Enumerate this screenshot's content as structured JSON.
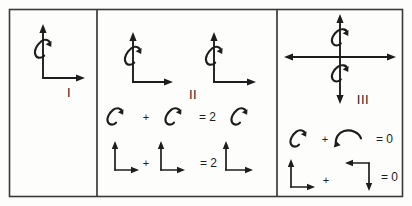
{
  "figure": {
    "background_color": "#fdfdfb",
    "ink_color": "#1d1d1d",
    "border_color": "#3a3a3a",
    "width": 412,
    "height": 206
  },
  "panels": [
    {
      "id": "panel-1",
      "label": "I",
      "description": "Single L-shaped axis pair with a counterclockwise rotation curl around the vertical axis",
      "items": [
        {
          "kind": "axis-pair",
          "name": "axis-pair-up-right"
        },
        {
          "kind": "rotation-curl",
          "name": "rotation-curl-ccw"
        }
      ],
      "equations": []
    },
    {
      "id": "panel-2",
      "label": "II",
      "description": "Two identical axis pairs with rotation curls, and two addition equations",
      "items": [
        {
          "kind": "axis-pair",
          "name": "axis-pair-up-right-left"
        },
        {
          "kind": "rotation-curl",
          "name": "rotation-curl-ccw-left"
        },
        {
          "kind": "axis-pair",
          "name": "axis-pair-up-right-right"
        },
        {
          "kind": "rotation-curl",
          "name": "rotation-curl-ccw-right"
        }
      ],
      "equations": [
        {
          "id": "panel-2-equation-1",
          "terms": [
            "curl-ccw",
            "curl-ccw"
          ],
          "operator": "+",
          "equals": "=",
          "coefficient": "2",
          "result": "curl-ccw"
        },
        {
          "id": "panel-2-equation-2",
          "terms": [
            "axes-up-right",
            "axes-up-right"
          ],
          "operator": "+",
          "equals": "=",
          "coefficient": "2",
          "result": "axes-up-right"
        }
      ]
    },
    {
      "id": "panel-3",
      "label": "III",
      "description": "Full cross of double-headed axes with two opposing rotation curls, and two cancelling equations",
      "items": [
        {
          "kind": "axis-cross",
          "name": "axis-cross-double-headed"
        },
        {
          "kind": "rotation-curl",
          "name": "rotation-curl-upper"
        },
        {
          "kind": "rotation-curl",
          "name": "rotation-curl-lower"
        }
      ],
      "equations": [
        {
          "id": "panel-3-equation-1",
          "terms": [
            "curl-ccw",
            "curl-cw"
          ],
          "operator": "+",
          "equals": "=",
          "coefficient": "0",
          "result": "zero"
        },
        {
          "id": "panel-3-equation-2",
          "terms": [
            "axes-up-right",
            "axes-left-down"
          ],
          "operator": "+",
          "equals": "=",
          "coefficient": "0",
          "result": "zero"
        }
      ]
    }
  ],
  "symbols": {
    "plus": "+",
    "equals_two": "= 2",
    "equals_zero": "= 0",
    "equals": "=",
    "two": "2",
    "zero": "0"
  }
}
